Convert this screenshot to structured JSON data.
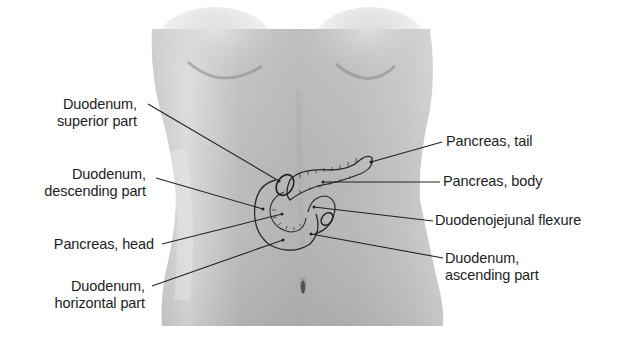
{
  "figure": {
    "colors": {
      "background": "#ffffff",
      "skin_light": "#d8d8d8",
      "skin_mid": "#bdbdbd",
      "skin_dark": "#9a9a9a",
      "outline": "#2a2a2a",
      "leader_line": "#222222",
      "text": "#1d1d1d"
    }
  },
  "labels_left": [
    {
      "id": "duodenum-superior",
      "lines": [
        "Duodenum,",
        "superior part"
      ]
    },
    {
      "id": "duodenum-descending",
      "lines": [
        "Duodenum,",
        "descending part"
      ]
    },
    {
      "id": "pancreas-head",
      "lines": [
        "Pancreas, head"
      ]
    },
    {
      "id": "duodenum-horizontal",
      "lines": [
        "Duodenum,",
        "horizontal part"
      ]
    }
  ],
  "labels_right": [
    {
      "id": "pancreas-tail",
      "lines": [
        "Pancreas, tail"
      ]
    },
    {
      "id": "pancreas-body",
      "lines": [
        "Pancreas, body"
      ]
    },
    {
      "id": "duodenojejunal-flexure",
      "lines": [
        "Duodenojejunal flexure"
      ]
    },
    {
      "id": "duodenum-ascending",
      "lines": [
        "Duodenum,",
        "ascending part"
      ]
    }
  ]
}
